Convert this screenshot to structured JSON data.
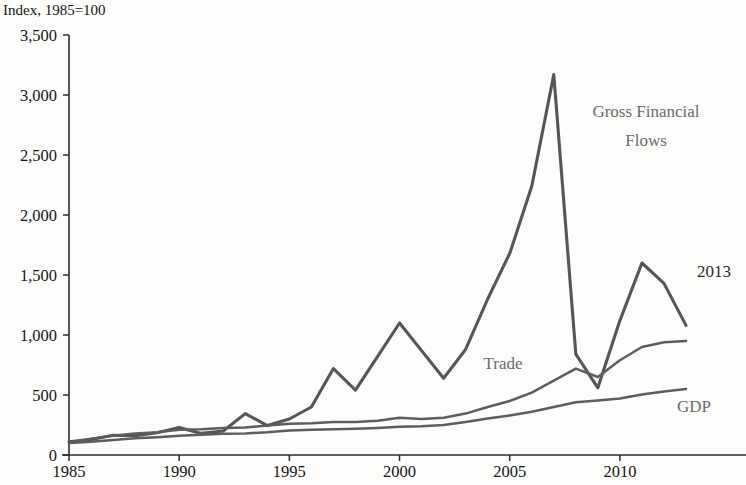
{
  "title": {
    "line1": "and Financial Flows, 1985–2013",
    "full": "Global Integration: Trade, GDP, and Financial Flows, 1985–2013"
  },
  "axis_unit_caption": "Index, 1985=100",
  "annotations": {
    "gross_financial_flows_line1": "Gross Financial",
    "gross_financial_flows_line2": "Flows",
    "trade": "Trade",
    "gdp": "GDP",
    "end_year": "2013"
  },
  "chart_data": {
    "type": "line",
    "xlabel": "",
    "ylabel": "Index, 1985=100",
    "xlim": [
      1985,
      2013
    ],
    "ylim": [
      0,
      3500
    ],
    "grid": false,
    "legend": "inline-annotations",
    "x_ticks": [
      "1985",
      "1990",
      "1995",
      "2000",
      "2005",
      "2010"
    ],
    "x_tick_values": [
      1985,
      1990,
      1995,
      2000,
      2005,
      2010
    ],
    "y_ticks": [
      "0",
      "500",
      "1,000",
      "1,500",
      "2,000",
      "2,500",
      "3,000",
      "3,500"
    ],
    "y_tick_values": [
      0,
      500,
      1000,
      1500,
      2000,
      2500,
      3000,
      3500
    ],
    "x": [
      1985,
      1986,
      1987,
      1988,
      1989,
      1990,
      1991,
      1992,
      1993,
      1994,
      1995,
      1996,
      1997,
      1998,
      1999,
      2000,
      2001,
      2002,
      2003,
      2004,
      2005,
      2006,
      2007,
      2008,
      2009,
      2010,
      2011,
      2012,
      2013
    ],
    "series": [
      {
        "name": "Gross Financial Flows",
        "color": "#565656",
        "values": [
          110,
          130,
          165,
          160,
          185,
          230,
          180,
          200,
          345,
          245,
          300,
          400,
          720,
          540,
          820,
          1100,
          870,
          640,
          880,
          1300,
          1680,
          2240,
          3170,
          840,
          560,
          1120,
          1600,
          1430,
          1080
        ]
      },
      {
        "name": "Trade",
        "color": "#5d5d5d",
        "values": [
          100,
          135,
          160,
          180,
          190,
          210,
          215,
          225,
          230,
          245,
          260,
          265,
          275,
          275,
          285,
          310,
          300,
          310,
          345,
          400,
          450,
          520,
          620,
          720,
          650,
          790,
          900,
          940,
          950
        ]
      },
      {
        "name": "GDP",
        "color": "#5d5d5d",
        "values": [
          100,
          110,
          125,
          140,
          148,
          160,
          168,
          178,
          180,
          190,
          205,
          210,
          215,
          218,
          225,
          235,
          240,
          250,
          275,
          305,
          330,
          360,
          400,
          440,
          455,
          470,
          505,
          530,
          550
        ]
      }
    ]
  }
}
